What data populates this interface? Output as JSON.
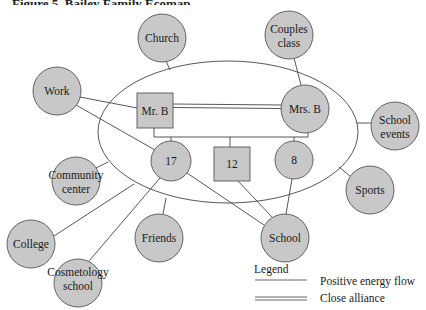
{
  "figure": {
    "title": "Figure 5. Bailey Family Ecomap",
    "title_visibility": "clipped at top edge"
  },
  "colors": {
    "node_fill": "#c8c8c8",
    "node_stroke": "#555555",
    "line": "#444444",
    "background": "#ffffff"
  },
  "household": {
    "boundary": {
      "cx": 228,
      "cy": 132,
      "rx": 130,
      "ry": 71
    },
    "members": [
      {
        "id": "mr_b",
        "label": "Mr. B",
        "shape": "square",
        "x": 137,
        "y": 93,
        "w": 36,
        "h": 35
      },
      {
        "id": "mrs_b",
        "label": "Mrs. B",
        "shape": "circle",
        "cx": 305,
        "cy": 109,
        "r": 24
      },
      {
        "id": "child_17",
        "label": "17",
        "shape": "circle",
        "cx": 171,
        "cy": 161,
        "r": 20
      },
      {
        "id": "child_12",
        "label": "12",
        "shape": "square",
        "x": 214,
        "y": 147,
        "w": 36,
        "h": 34
      },
      {
        "id": "child_8",
        "label": "8",
        "shape": "circle",
        "cx": 294,
        "cy": 160,
        "r": 19
      }
    ]
  },
  "external_systems": [
    {
      "id": "church",
      "lines": [
        "Church"
      ],
      "cx": 162,
      "cy": 38,
      "r": 24
    },
    {
      "id": "couples_class",
      "lines": [
        "Couples",
        "class"
      ],
      "cx": 289,
      "cy": 35,
      "r": 24
    },
    {
      "id": "work",
      "lines": [
        "Work"
      ],
      "cx": 57,
      "cy": 91,
      "r": 24
    },
    {
      "id": "school_events",
      "lines": [
        "School",
        "events"
      ],
      "cx": 395,
      "cy": 126,
      "r": 24
    },
    {
      "id": "community_center",
      "lines": [
        "Community",
        "center"
      ],
      "cx": 76,
      "cy": 181,
      "r": 24
    },
    {
      "id": "sports",
      "lines": [
        "Sports"
      ],
      "cx": 370,
      "cy": 190,
      "r": 24
    },
    {
      "id": "college",
      "lines": [
        "College"
      ],
      "cx": 31,
      "cy": 244,
      "r": 24
    },
    {
      "id": "friends",
      "lines": [
        "Friends"
      ],
      "cx": 159,
      "cy": 238,
      "r": 24
    },
    {
      "id": "school",
      "lines": [
        "School"
      ],
      "cx": 285,
      "cy": 238,
      "r": 24
    },
    {
      "id": "cosmetology_school",
      "lines": [
        "Cosmetology",
        "school"
      ],
      "cx": 78,
      "cy": 283,
      "r": 24
    }
  ],
  "connections": [
    {
      "from": "church",
      "to": "household_boundary",
      "type": "positive_energy_flow"
    },
    {
      "from": "couples_class",
      "to": "mrs_b",
      "type": "positive_energy_flow"
    },
    {
      "from": "work",
      "to": "mr_b",
      "type": "positive_energy_flow"
    },
    {
      "from": "work",
      "to": "child_17",
      "type": "positive_energy_flow"
    },
    {
      "from": "school_events",
      "to": "household_boundary",
      "type": "positive_energy_flow"
    },
    {
      "from": "community_center",
      "to": "household_boundary",
      "type": "positive_energy_flow"
    },
    {
      "from": "sports",
      "to": "household_boundary",
      "type": "positive_energy_flow"
    },
    {
      "from": "college",
      "to": "child_17",
      "type": "positive_energy_flow"
    },
    {
      "from": "cosmetology_school",
      "to": "child_17",
      "type": "positive_energy_flow"
    },
    {
      "from": "friends",
      "to": "household_boundary",
      "type": "positive_energy_flow"
    },
    {
      "from": "school",
      "to": "child_17",
      "type": "positive_energy_flow"
    },
    {
      "from": "school",
      "to": "child_12",
      "type": "positive_energy_flow"
    },
    {
      "from": "school",
      "to": "child_8",
      "type": "positive_energy_flow"
    },
    {
      "from": "mr_b",
      "to": "mrs_b",
      "type": "close_alliance"
    }
  ],
  "legend": {
    "title": "Legend",
    "items": [
      {
        "label": "Positive energy flow",
        "style": "single line"
      },
      {
        "label": "Close alliance",
        "style": "double line"
      }
    ]
  }
}
